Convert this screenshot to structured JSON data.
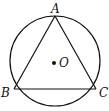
{
  "diagram": {
    "points": [
      {
        "id": "A",
        "label": "A"
      },
      {
        "id": "B",
        "label": "B"
      },
      {
        "id": "C",
        "label": "C"
      },
      {
        "id": "O",
        "label": "O"
      }
    ],
    "segments": [
      [
        "A",
        "B"
      ],
      [
        "B",
        "C"
      ],
      [
        "C",
        "A"
      ]
    ],
    "stroke_color": "#111111"
  }
}
